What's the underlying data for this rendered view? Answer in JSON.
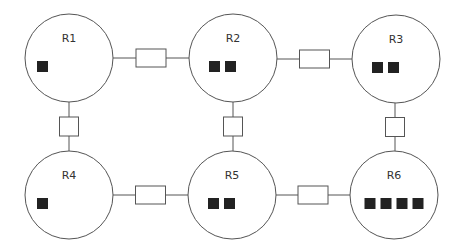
{
  "diagram": {
    "colors": {
      "stroke": "#555555",
      "token": "#222222",
      "background": "#ffffff"
    },
    "rooms": [
      {
        "id": "R1",
        "label": "R1",
        "cx": 69,
        "cy": 58,
        "r": 44,
        "tokens": 1
      },
      {
        "id": "R2",
        "label": "R2",
        "cx": 233,
        "cy": 58,
        "r": 44,
        "tokens": 2
      },
      {
        "id": "R3",
        "label": "R3",
        "cx": 396,
        "cy": 59,
        "r": 44,
        "tokens": 2
      },
      {
        "id": "R4",
        "label": "R4",
        "cx": 69,
        "cy": 195,
        "r": 44,
        "tokens": 1
      },
      {
        "id": "R5",
        "label": "R5",
        "cx": 232,
        "cy": 195,
        "r": 44,
        "tokens": 2
      },
      {
        "id": "R6",
        "label": "R6",
        "cx": 394,
        "cy": 195,
        "r": 44,
        "tokens": 4
      }
    ],
    "connections": [
      {
        "from": "R1",
        "to": "R2",
        "orientation": "horizontal"
      },
      {
        "from": "R2",
        "to": "R3",
        "orientation": "horizontal"
      },
      {
        "from": "R4",
        "to": "R5",
        "orientation": "horizontal"
      },
      {
        "from": "R5",
        "to": "R6",
        "orientation": "horizontal"
      },
      {
        "from": "R1",
        "to": "R4",
        "orientation": "vertical"
      },
      {
        "from": "R2",
        "to": "R5",
        "orientation": "vertical"
      },
      {
        "from": "R3",
        "to": "R6",
        "orientation": "vertical"
      }
    ]
  }
}
